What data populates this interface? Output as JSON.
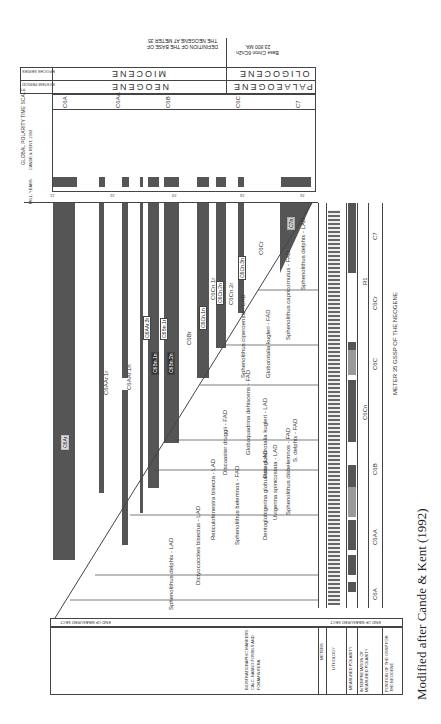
{
  "figure": {
    "orientation": "rotated 180deg / portrait of landscape chart",
    "caption": "Modified after Cande & Kent (1992)",
    "top_annotations": {
      "definition": "DEFINITION OF THE BASE OF THE NEOGENE AT METER 35",
      "base_chron": "Base Chron 6Cn2n 23.800 MA."
    },
    "header_rows": {
      "epochs_label": "EPOCHS SERIES",
      "period_label": "SYSTEM PERIOD",
      "epochs": [
        "MIOCENE",
        "OLIGOCENE"
      ],
      "periods": [
        "NEOGENE",
        "PALAEOGENE"
      ]
    },
    "timescale": {
      "title": "GLOBAL POLARITY TIME SCALE",
      "subtitle": "CANDE & KENT, 1992",
      "axis_label": "MILL. YEARS",
      "ticks": [
        "21",
        "22",
        "23",
        "24",
        "25"
      ],
      "chrons": [
        "C6A",
        "C6AA",
        "C6B",
        "C6C",
        "C7"
      ],
      "subchrons": [
        "C6An",
        "C6Ar",
        "C6AAn",
        "C6AAr",
        "C6Bn",
        "C6Br",
        "C6Cn",
        "C6Cr",
        "C7n",
        "C7r"
      ]
    },
    "polarity_labels": [
      "C6Ar",
      "C6AAr.1r",
      "C6AAr.1n",
      "C6AAr.2r",
      "C6AAr.3r",
      "C6Bn.1r",
      "C6Bn.1n",
      "C6Bn.2n",
      "C6Br",
      "C6Cn.1n",
      "C6Cn.1r",
      "C6Cn.2n",
      "C6Cn.2r",
      "C6Cn.3n",
      "C6Cr",
      "C7n"
    ],
    "biostratigraphic_markers": [
      "Sphenolithus delphix - LAD",
      "Sphenolithus capricornutus - FAD",
      "S. delphix - FAD",
      "Globorotalia kugleri - FAD",
      "Sphenolithus ciperoensis - LAD",
      "Discoaster druggii - FAD",
      "Paragloborotalia kugleri - LAD",
      "Globoquadrina dehiscens - FAD",
      "Sphenolithus disbelemnos - FAD",
      "Dentoglobigerina globularis - LAD",
      "Uvigerina spinicostata - LAD",
      "Sphenolithus belemnos - FAD",
      "Reticulofenestra bisecta - LAD",
      "Helicosphaera euphratis",
      "Globigerinoides primordius - FAD",
      "Dictyococcites bisectus - LAD",
      "Globigerina ciperoensis"
    ],
    "bottom_columns": {
      "end_label": "END OF MEASURED SECT",
      "biostrat_header": "BIOSTRATIGRAPHIC MARKERS CALC. NANNO FOSSILS AND FORAMINIFERA",
      "meters": "METERS",
      "lithology": "LITHOLOGY",
      "measured_polarity": "MEASURED POLARITY",
      "interpretation": "INTERPRETATION OF MEASURED POLARITY",
      "position": "POSITION OF THE GSSP FOR THE NEOGENE",
      "gssp_label": "METER 35 GSSP OF THE NEOGENE",
      "zone_labels": [
        "C7",
        "C6Cr",
        "C6Cn",
        "C6Br",
        "C6Bn",
        "C6B",
        "C6AA",
        "C6A",
        "C6C"
      ],
      "polarity_labels": [
        "R1",
        "N1",
        "R2",
        "N2",
        "R3",
        "N3",
        "R4",
        "N4",
        "R5"
      ]
    }
  }
}
